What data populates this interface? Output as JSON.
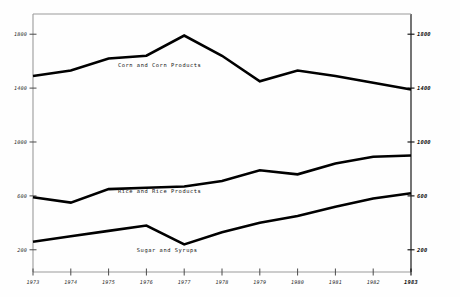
{
  "chart_data": {
    "type": "line",
    "title": "",
    "subtitle": "",
    "xlabel": "",
    "ylabel": "",
    "x": [
      1973,
      1974,
      1975,
      1976,
      1977,
      1978,
      1979,
      1980,
      1981,
      1982,
      1983
    ],
    "categories": [
      "1973",
      "1974",
      "1975",
      "1976",
      "1977",
      "1978",
      "1979",
      "1980",
      "1981",
      "1982",
      "1983"
    ],
    "xlim": [
      1973,
      1983
    ],
    "ylim": [
      0,
      1950
    ],
    "grid": false,
    "legend_position": "inline-annotation",
    "left_axis_ticks": [
      "1800",
      "1400",
      "1000",
      "600",
      "200"
    ],
    "left_axis_tick_values": [
      1800,
      1400,
      1000,
      600,
      200
    ],
    "right_axis_ticks": [
      "1800",
      "1400",
      "1000",
      "600",
      "200"
    ],
    "right_axis_tick_values": [
      1800,
      1400,
      1000,
      600,
      200
    ],
    "x_tick_labels": [
      "1973",
      "1974",
      "1975",
      "1976",
      "1977",
      "1978",
      "1979",
      "1980",
      "1981",
      "1982",
      "1983"
    ],
    "bold_x_tick": "1983",
    "bold_right_axis": true,
    "series": [
      {
        "name": "Corn and Corn Products",
        "label": "Corn and Corn Products",
        "label_x_year": 1976.35,
        "label_y_value": 1560,
        "values": [
          1490,
          1530,
          1620,
          1640,
          1790,
          1640,
          1450,
          1530,
          1490,
          1440,
          1390
        ]
      },
      {
        "name": "Rice and Rice Products",
        "label": "Rice and Rice Products",
        "label_x_year": 1976.35,
        "label_y_value": 620,
        "values": [
          590,
          550,
          650,
          660,
          670,
          710,
          790,
          760,
          840,
          890,
          900
        ]
      },
      {
        "name": "Sugar and Syrups",
        "label": "Sugar and Syrups",
        "label_x_year": 1976.55,
        "label_y_value": 185,
        "values": [
          260,
          300,
          340,
          380,
          240,
          330,
          400,
          450,
          520,
          580,
          620
        ]
      }
    ]
  }
}
